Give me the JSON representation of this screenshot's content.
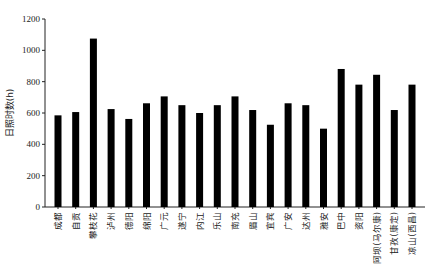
{
  "chart_data": {
    "type": "bar",
    "title": "",
    "xlabel": "",
    "ylabel": "日照时数(h)",
    "ylim": [
      0,
      1200
    ],
    "yticks": [
      0,
      200,
      400,
      600,
      800,
      1000,
      1200
    ],
    "grid": false,
    "legend": "none",
    "bar_color": "#000000",
    "categories": [
      "成都",
      "自贡",
      "攀枝花",
      "泸州",
      "德阳",
      "绵阳",
      "广元",
      "遂宁",
      "内江",
      "乐山",
      "南充",
      "眉山",
      "宜宾",
      "广安",
      "达州",
      "雅安",
      "巴中",
      "资阳",
      "阿坝(马尔康)",
      "甘孜(康定)",
      "凉山(西昌)"
    ],
    "values": [
      585,
      606,
      1075,
      625,
      562,
      662,
      706,
      650,
      600,
      650,
      706,
      619,
      525,
      662,
      650,
      500,
      881,
      781,
      844,
      619,
      781
    ]
  }
}
